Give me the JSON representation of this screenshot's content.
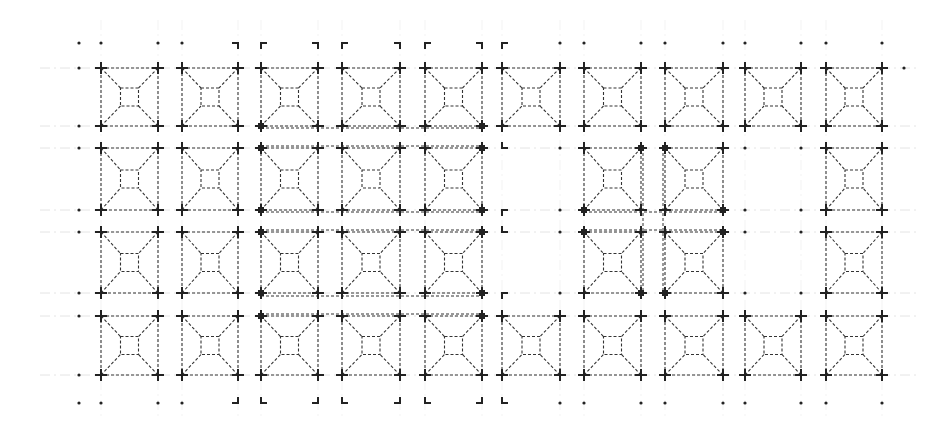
{
  "drawing": {
    "type": "architectural-plan",
    "description": "Plan of a grid of square bays, each with a pyramidal skylight/coffer (outer square with inner square connected by diagonals), drawn with dashed lines",
    "width": 936,
    "height": 426,
    "colors": {
      "line": "#333333",
      "grid": "#dddddd",
      "post": "#222222",
      "background": "#ffffff"
    },
    "columns_x": [
      [
        101,
        158
      ],
      [
        182,
        238
      ],
      [
        261,
        318
      ],
      [
        342,
        400
      ],
      [
        425,
        482
      ],
      [
        502,
        560
      ],
      [
        584,
        641
      ],
      [
        665,
        723
      ],
      [
        745,
        801
      ],
      [
        826,
        882
      ]
    ],
    "rows_y": [
      [
        68,
        126
      ],
      [
        148,
        210
      ],
      [
        232,
        293
      ],
      [
        316,
        375
      ]
    ],
    "dot_rows_y": [
      43,
      403
    ],
    "dot_cols_x": [
      79,
      101,
      158,
      182,
      238,
      261,
      318,
      342,
      400,
      425,
      482,
      502,
      560,
      584,
      641,
      665,
      723,
      745,
      801,
      826,
      882
    ],
    "bays": [
      {
        "row": 0,
        "col": 0
      },
      {
        "row": 0,
        "col": 1
      },
      {
        "row": 0,
        "col": 2
      },
      {
        "row": 0,
        "col": 3
      },
      {
        "row": 0,
        "col": 4
      },
      {
        "row": 0,
        "col": 5
      },
      {
        "row": 0,
        "col": 6
      },
      {
        "row": 0,
        "col": 7
      },
      {
        "row": 0,
        "col": 8
      },
      {
        "row": 0,
        "col": 9
      },
      {
        "row": 1,
        "col": 0
      },
      {
        "row": 1,
        "col": 1
      },
      {
        "row": 1,
        "col": 2
      },
      {
        "row": 1,
        "col": 3
      },
      {
        "row": 1,
        "col": 4
      },
      {
        "row": 1,
        "col": 6
      },
      {
        "row": 1,
        "col": 7
      },
      {
        "row": 1,
        "col": 9
      },
      {
        "row": 2,
        "col": 0
      },
      {
        "row": 2,
        "col": 1
      },
      {
        "row": 2,
        "col": 2
      },
      {
        "row": 2,
        "col": 3
      },
      {
        "row": 2,
        "col": 4
      },
      {
        "row": 2,
        "col": 6
      },
      {
        "row": 2,
        "col": 7
      },
      {
        "row": 2,
        "col": 9
      },
      {
        "row": 3,
        "col": 0
      },
      {
        "row": 3,
        "col": 1
      },
      {
        "row": 3,
        "col": 2
      },
      {
        "row": 3,
        "col": 3
      },
      {
        "row": 3,
        "col": 4
      },
      {
        "row": 3,
        "col": 5
      },
      {
        "row": 3,
        "col": 6
      },
      {
        "row": 3,
        "col": 7
      },
      {
        "row": 3,
        "col": 8
      },
      {
        "row": 3,
        "col": 9
      }
    ],
    "beams": [
      {
        "x1": 261,
        "x2": 482,
        "y": 128
      },
      {
        "x1": 261,
        "x2": 482,
        "y": 146
      },
      {
        "x1": 261,
        "x2": 482,
        "y": 212
      },
      {
        "x1": 261,
        "x2": 482,
        "y": 230
      },
      {
        "x1": 261,
        "x2": 482,
        "y": 296
      },
      {
        "x1": 261,
        "x2": 482,
        "y": 314
      },
      {
        "x1": 584,
        "x2": 723,
        "y": 212
      },
      {
        "x1": 584,
        "x2": 723,
        "y": 230
      }
    ],
    "vertical_beams": [
      {
        "x": 643,
        "y1": 148,
        "y2": 293
      },
      {
        "x": 663,
        "y1": 148,
        "y2": 293
      }
    ],
    "square_posts": [
      [
        261,
        126
      ],
      [
        482,
        126
      ],
      [
        261,
        148
      ],
      [
        482,
        148
      ],
      [
        261,
        210
      ],
      [
        482,
        210
      ],
      [
        261,
        232
      ],
      [
        482,
        232
      ],
      [
        261,
        293
      ],
      [
        482,
        293
      ],
      [
        261,
        316
      ],
      [
        482,
        316
      ],
      [
        641,
        148
      ],
      [
        665,
        148
      ],
      [
        584,
        210
      ],
      [
        723,
        210
      ],
      [
        584,
        232
      ],
      [
        723,
        232
      ],
      [
        641,
        293
      ],
      [
        665,
        293
      ]
    ],
    "corner_brackets": [
      {
        "x": 238,
        "y": 43,
        "dir": "tr"
      },
      {
        "x": 261,
        "y": 43,
        "dir": "tl"
      },
      {
        "x": 318,
        "y": 43,
        "dir": "tr"
      },
      {
        "x": 342,
        "y": 43,
        "dir": "tl"
      },
      {
        "x": 400,
        "y": 43,
        "dir": "tr"
      },
      {
        "x": 425,
        "y": 43,
        "dir": "tl"
      },
      {
        "x": 482,
        "y": 43,
        "dir": "tr"
      },
      {
        "x": 502,
        "y": 43,
        "dir": "tl"
      },
      {
        "x": 502,
        "y": 148,
        "dir": "bl"
      },
      {
        "x": 502,
        "y": 210,
        "dir": "tl"
      },
      {
        "x": 502,
        "y": 232,
        "dir": "bl"
      },
      {
        "x": 502,
        "y": 293,
        "dir": "tl"
      },
      {
        "x": 238,
        "y": 403,
        "dir": "br"
      },
      {
        "x": 261,
        "y": 403,
        "dir": "bl"
      },
      {
        "x": 318,
        "y": 403,
        "dir": "br"
      },
      {
        "x": 342,
        "y": 403,
        "dir": "bl"
      },
      {
        "x": 400,
        "y": 403,
        "dir": "br"
      },
      {
        "x": 425,
        "y": 403,
        "dir": "bl"
      },
      {
        "x": 482,
        "y": 403,
        "dir": "br"
      },
      {
        "x": 502,
        "y": 403,
        "dir": "bl"
      }
    ],
    "isolated_dots": [
      [
        79,
        68
      ],
      [
        79,
        126
      ],
      [
        79,
        148
      ],
      [
        79,
        210
      ],
      [
        79,
        232
      ],
      [
        79,
        293
      ],
      [
        79,
        316
      ],
      [
        79,
        375
      ],
      [
        560,
        148
      ],
      [
        560,
        210
      ],
      [
        560,
        232
      ],
      [
        560,
        293
      ],
      [
        745,
        148
      ],
      [
        801,
        148
      ],
      [
        745,
        210
      ],
      [
        801,
        210
      ],
      [
        745,
        232
      ],
      [
        801,
        232
      ],
      [
        745,
        293
      ],
      [
        801,
        293
      ],
      [
        904,
        68
      ]
    ]
  }
}
